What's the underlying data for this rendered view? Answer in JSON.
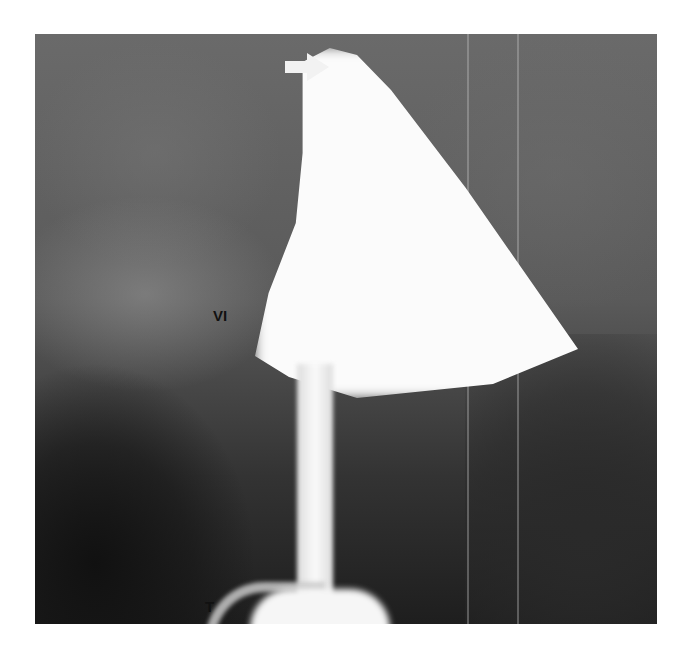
{
  "image": {
    "description": "Radiograph (hysterosalpingogram) showing contrast-filled uterine cavity with cannula",
    "labels": {
      "vi": "VI",
      "t": "T"
    },
    "annotations": {
      "arrow": "white arrow pointing right toward the top of the contrast-filled cavity"
    },
    "colors": {
      "background": "#ffffff",
      "contrast": "#fbfbfb",
      "tissue": "#5a5a5a"
    }
  }
}
